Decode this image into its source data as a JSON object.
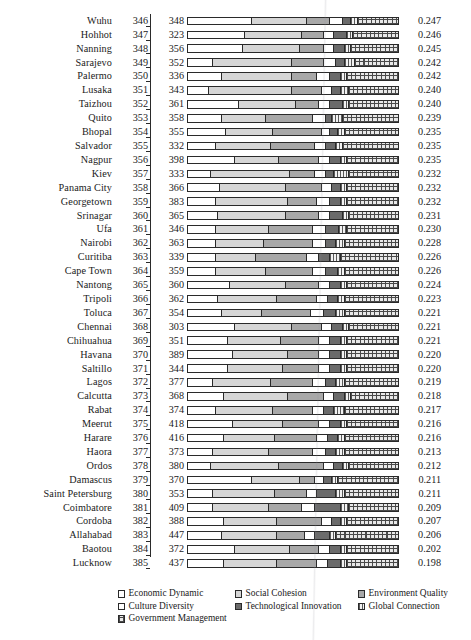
{
  "chart_data": {
    "type": "bar",
    "subtype": "horizontal-stacked-100-percent",
    "title": "",
    "xlabel": "",
    "ylabel": "",
    "grid": false,
    "legend_position": "bottom",
    "columns": [
      "City",
      "Rank",
      "Population",
      "Composite Index"
    ],
    "series": [
      {
        "name": "Economic Dynamic",
        "key": "eco",
        "swatch": "white"
      },
      {
        "name": "Social Cohesion",
        "key": "soc",
        "swatch": "light-gray"
      },
      {
        "name": "Environment Quality",
        "key": "env",
        "swatch": "medium-gray"
      },
      {
        "name": "Culture Diversity",
        "key": "cul",
        "swatch": "white"
      },
      {
        "name": "Technological Innovation",
        "key": "tec",
        "swatch": "dark-gray"
      },
      {
        "name": "Global Connection",
        "key": "glo",
        "swatch": "vertical-dotted"
      },
      {
        "name": "Government Management",
        "key": "gov",
        "swatch": "cross-hatch"
      }
    ],
    "categories": [
      "Wuhu",
      "Hohhot",
      "Nanning",
      "Sarajevo",
      "Palermo",
      "Lusaka",
      "Taizhou",
      "Quito",
      "Bhopal",
      "Salvador",
      "Nagpur",
      "Kiev",
      "Panama City",
      "Georgetown",
      "Srinagar",
      "Ufa",
      "Nairobi",
      "Curitiba",
      "Cape Town",
      "Nantong",
      "Tripoli",
      "Toluca",
      "Chennai",
      "Chihuahua",
      "Havana",
      "Saltillo",
      "Lagos",
      "Calcutta",
      "Rabat",
      "Meerut",
      "Harare",
      "Haora",
      "Ordos",
      "Damascus",
      "Saint Petersburg",
      "Coimbatore",
      "Cordoba",
      "Allahabad",
      "Baotou",
      "Lucknow"
    ],
    "rows": [
      {
        "city": "Wuhu",
        "rank": "346",
        "pop": "348",
        "value": "0.247",
        "segments": [
          30,
          26,
          11,
          6,
          4,
          3,
          20
        ]
      },
      {
        "city": "Hohhot",
        "rank": "347",
        "pop": "323",
        "value": "0.246",
        "segments": [
          27,
          27,
          10,
          5,
          6,
          3,
          22
        ]
      },
      {
        "city": "Nanning",
        "rank": "348",
        "pop": "356",
        "value": "0.245",
        "segments": [
          26,
          27,
          11,
          5,
          5,
          3,
          23
        ]
      },
      {
        "city": "Sarajevo",
        "rank": "349",
        "pop": "352",
        "value": "0.242",
        "segments": [
          12,
          37,
          15,
          6,
          4,
          5,
          21
        ]
      },
      {
        "city": "Palermo",
        "rank": "350",
        "pop": "336",
        "value": "0.242",
        "segments": [
          16,
          33,
          12,
          6,
          5,
          3,
          25
        ]
      },
      {
        "city": "Lusaka",
        "rank": "351",
        "pop": "343",
        "value": "0.240",
        "segments": [
          10,
          39,
          14,
          5,
          4,
          4,
          24
        ]
      },
      {
        "city": "Taizhou",
        "rank": "352",
        "pop": "361",
        "value": "0.240",
        "segments": [
          24,
          27,
          11,
          5,
          6,
          3,
          24
        ]
      },
      {
        "city": "Quito",
        "rank": "353",
        "pop": "358",
        "value": "0.239",
        "segments": [
          16,
          21,
          22,
          6,
          3,
          5,
          27
        ]
      },
      {
        "city": "Bhopal",
        "rank": "354",
        "pop": "355",
        "value": "0.235",
        "segments": [
          18,
          22,
          23,
          4,
          4,
          3,
          26
        ]
      },
      {
        "city": "Salvador",
        "rank": "355",
        "pop": "332",
        "value": "0.235",
        "segments": [
          13,
          26,
          21,
          5,
          5,
          3,
          27
        ]
      },
      {
        "city": "Nagpur",
        "rank": "356",
        "pop": "398",
        "value": "0.235",
        "segments": [
          22,
          21,
          19,
          5,
          5,
          3,
          25
        ]
      },
      {
        "city": "Kiev",
        "rank": "357",
        "pop": "333",
        "value": "0.232",
        "segments": [
          11,
          37,
          12,
          5,
          4,
          7,
          24
        ]
      },
      {
        "city": "Panama City",
        "rank": "358",
        "pop": "366",
        "value": "0.232",
        "segments": [
          15,
          31,
          17,
          5,
          4,
          3,
          25
        ]
      },
      {
        "city": "Georgetown",
        "rank": "359",
        "pop": "383",
        "value": "0.232",
        "segments": [
          13,
          34,
          14,
          6,
          5,
          3,
          25
        ]
      },
      {
        "city": "Srinagar",
        "rank": "360",
        "pop": "365",
        "value": "0.231",
        "segments": [
          14,
          32,
          16,
          5,
          6,
          3,
          24
        ]
      },
      {
        "city": "Ufa",
        "rank": "361",
        "pop": "346",
        "value": "0.230",
        "segments": [
          13,
          25,
          21,
          6,
          6,
          4,
          25
        ]
      },
      {
        "city": "Nairobi",
        "rank": "362",
        "pop": "363",
        "value": "0.228",
        "segments": [
          13,
          23,
          23,
          6,
          5,
          4,
          26
        ]
      },
      {
        "city": "Curitiba",
        "rank": "363",
        "pop": "339",
        "value": "0.226",
        "segments": [
          13,
          19,
          24,
          6,
          5,
          5,
          28
        ]
      },
      {
        "city": "Cape Town",
        "rank": "364",
        "pop": "359",
        "value": "0.226",
        "segments": [
          13,
          24,
          22,
          6,
          6,
          3,
          26
        ]
      },
      {
        "city": "Nantong",
        "rank": "365",
        "pop": "360",
        "value": "0.224",
        "segments": [
          20,
          26,
          16,
          5,
          5,
          3,
          25
        ]
      },
      {
        "city": "Tripoli",
        "rank": "366",
        "pop": "362",
        "value": "0.223",
        "segments": [
          14,
          28,
          19,
          5,
          5,
          3,
          26
        ]
      },
      {
        "city": "Toluca",
        "rank": "367",
        "pop": "354",
        "value": "0.221",
        "segments": [
          16,
          19,
          23,
          6,
          6,
          4,
          26
        ]
      },
      {
        "city": "Chennai",
        "rank": "368",
        "pop": "303",
        "value": "0.221",
        "segments": [
          22,
          27,
          14,
          5,
          5,
          3,
          24
        ]
      },
      {
        "city": "Chihuahua",
        "rank": "369",
        "pop": "351",
        "value": "0.221",
        "segments": [
          19,
          25,
          18,
          5,
          5,
          3,
          25
        ]
      },
      {
        "city": "Havana",
        "rank": "370",
        "pop": "389",
        "value": "0.220",
        "segments": [
          21,
          26,
          15,
          5,
          5,
          3,
          25
        ]
      },
      {
        "city": "Saltillo",
        "rank": "371",
        "pop": "344",
        "value": "0.220",
        "segments": [
          19,
          26,
          17,
          5,
          5,
          3,
          25
        ]
      },
      {
        "city": "Lagos",
        "rank": "372",
        "pop": "377",
        "value": "0.219",
        "segments": [
          12,
          27,
          20,
          6,
          5,
          4,
          26
        ]
      },
      {
        "city": "Calcutta",
        "rank": "373",
        "pop": "368",
        "value": "0.218",
        "segments": [
          17,
          30,
          17,
          5,
          5,
          3,
          23
        ]
      },
      {
        "city": "Rabat",
        "rank": "374",
        "pop": "374",
        "value": "0.217",
        "segments": [
          13,
          27,
          19,
          5,
          5,
          5,
          26
        ]
      },
      {
        "city": "Meerut",
        "rank": "375",
        "pop": "418",
        "value": "0.216",
        "segments": [
          21,
          24,
          17,
          5,
          5,
          3,
          25
        ]
      },
      {
        "city": "Harare",
        "rank": "376",
        "pop": "416",
        "value": "0.216",
        "segments": [
          17,
          24,
          20,
          5,
          5,
          3,
          26
        ]
      },
      {
        "city": "Haora",
        "rank": "377",
        "pop": "373",
        "value": "0.213",
        "segments": [
          12,
          26,
          21,
          6,
          5,
          4,
          26
        ]
      },
      {
        "city": "Ordos",
        "rank": "378",
        "pop": "380",
        "value": "0.212",
        "segments": [
          11,
          32,
          21,
          5,
          4,
          3,
          24
        ]
      },
      {
        "city": "Damascus",
        "rank": "379",
        "pop": "370",
        "value": "0.211",
        "segments": [
          30,
          23,
          7,
          4,
          4,
          3,
          29
        ]
      },
      {
        "city": "Saint Petersburg",
        "rank": "380",
        "pop": "353",
        "value": "0.211",
        "segments": [
          12,
          29,
          15,
          5,
          9,
          4,
          26
        ]
      },
      {
        "city": "Coimbatore",
        "rank": "381",
        "pop": "409",
        "value": "0.209",
        "segments": [
          12,
          26,
          16,
          6,
          12,
          4,
          24
        ]
      },
      {
        "city": "Cordoba",
        "rank": "382",
        "pop": "388",
        "value": "0.207",
        "segments": [
          17,
          25,
          21,
          5,
          4,
          3,
          25
        ]
      },
      {
        "city": "Allahabad",
        "rank": "383",
        "pop": "447",
        "value": "0.206",
        "segments": [
          16,
          26,
          13,
          5,
          7,
          3,
          30
        ]
      },
      {
        "city": "Baotou",
        "rank": "384",
        "pop": "372",
        "value": "0.202",
        "segments": [
          22,
          26,
          14,
          5,
          5,
          3,
          25
        ]
      },
      {
        "city": "Lucknow",
        "rank": "385",
        "pop": "437",
        "value": "0.198",
        "segments": [
          17,
          25,
          19,
          5,
          6,
          3,
          25
        ]
      }
    ]
  },
  "legend": {
    "items": [
      {
        "label": "Economic Dynamic"
      },
      {
        "label": "Social Cohesion"
      },
      {
        "label": "Environment Quality"
      },
      {
        "label": "Culture Diversity"
      },
      {
        "label": "Technological Innovation"
      },
      {
        "label": "Global Connection"
      },
      {
        "label": "Government Management"
      }
    ]
  },
  "colors": {
    "economic_dynamic": "#ffffff",
    "social_cohesion": "#d6d6d6",
    "environment_quality": "#a8a8a8",
    "culture_diversity": "#ffffff",
    "technological_innovation": "#6b6b6b",
    "global_connection": "#f2f2f2",
    "government_management": "#e8e8e8",
    "outline": "#2a2a2a",
    "text": "#1a1a1a"
  }
}
